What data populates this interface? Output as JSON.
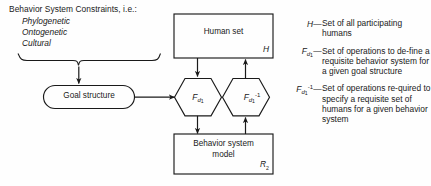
{
  "figure": {
    "constraints": {
      "title": "Behavior System Constraints, i.e.:",
      "items": [
        "Phylogenetic",
        "Ontogenetic",
        "Cultural"
      ]
    },
    "nodes": {
      "goal_structure": {
        "label": "Goal structure"
      },
      "human_set": {
        "label": "Human set",
        "tag": "H"
      },
      "behavior_model": {
        "label": "Behavior system\nmodel",
        "tag": "R",
        "tag_sub": "2"
      },
      "operator_forward": {
        "base": "F",
        "sub": "d",
        "subsub": "1"
      },
      "operator_inverse": {
        "base": "F",
        "sub": "d",
        "subsub": "1",
        "sup": "-1"
      }
    },
    "legend": [
      {
        "symbol_base": "H",
        "symbol_sub": "",
        "symbol_subsub": "",
        "symbol_sup": "",
        "dash": "—",
        "text": "Set of all participating humans"
      },
      {
        "symbol_base": "F",
        "symbol_sub": "d",
        "symbol_subsub": "1",
        "symbol_sup": "",
        "dash": "—",
        "text": "Set of operations to de-fine a requisite behavior system for a given goal structure"
      },
      {
        "symbol_base": "F",
        "symbol_sub": "d",
        "symbol_subsub": "1",
        "symbol_sup": "-1",
        "dash": "—",
        "text": "Set of operations re-quired to specify a requisite set of humans for a given behavior system"
      }
    ],
    "colors": {
      "stroke": "#1a1a1a",
      "background": "#fefefe",
      "text": "#1a1a1a"
    }
  }
}
